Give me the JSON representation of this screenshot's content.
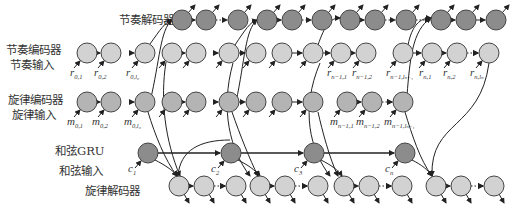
{
  "labels": {
    "rhythm_decoder": "节奏解码器",
    "rhythm_encoder": "节奏编码器",
    "rhythm_input": "节奏输入",
    "melody_encoder": "旋律编码器",
    "melody_input": "旋律输入",
    "chord_gru": "和弦GRU",
    "chord_input": "和弦输入",
    "melody_decoder": "旋律解码器"
  },
  "colors": {
    "dark_node": "#8c8c8c",
    "mid_node": "#b4b4b4",
    "light_node": "#d2d2d2",
    "stroke": "#444444",
    "text": "#333333"
  },
  "rows": {
    "rhythm_decoder": {
      "y": 20,
      "nodes": [
        182,
        206,
        238,
        267,
        292,
        322,
        350,
        375,
        406,
        441,
        466,
        496
      ]
    },
    "rhythm_encoder": {
      "y": 53,
      "nodes": [
        87,
        111,
        145,
        172,
        196,
        229,
        256,
        282,
        313,
        341,
        366,
        403,
        432,
        457,
        489
      ]
    },
    "melody_encoder": {
      "y": 102,
      "nodes": [
        87,
        111,
        145,
        172,
        196,
        229,
        256,
        282,
        313,
        347,
        372,
        403
      ]
    },
    "chord_gru": {
      "y": 153,
      "nodes": [
        148,
        231,
        314,
        405
      ]
    },
    "melody_decoder": {
      "y": 186,
      "nodes": [
        179,
        204,
        236,
        260,
        285,
        318,
        344,
        369,
        402,
        436,
        461,
        494
      ]
    }
  },
  "input_labels": {
    "rhythm": [
      {
        "base": "r",
        "sub": "0,1",
        "x": 70
      },
      {
        "base": "r",
        "sub": "0,2",
        "x": 94
      },
      {
        "base": "r",
        "sub": "0,l₀",
        "x": 126
      },
      {
        "base": "r",
        "sub": "n−1,1",
        "x": 327
      },
      {
        "base": "r",
        "sub": "n−1,2",
        "x": 352
      },
      {
        "base": "r",
        "sub": "n−1,lₙ₋₁",
        "x": 386
      },
      {
        "base": "r",
        "sub": "n,1",
        "x": 419
      },
      {
        "base": "r",
        "sub": "n,2",
        "x": 443
      },
      {
        "base": "r",
        "sub": "n,lₙ",
        "x": 470
      }
    ],
    "melody": [
      {
        "base": "m",
        "sub": "0,1",
        "x": 67
      },
      {
        "base": "m",
        "sub": "0,2",
        "x": 92
      },
      {
        "base": "m",
        "sub": "0,l₀",
        "x": 124
      },
      {
        "base": "m",
        "sub": "n−1,1",
        "x": 330
      },
      {
        "base": "m",
        "sub": "n−1,2",
        "x": 356
      },
      {
        "base": "m",
        "sub": "n−1,lₙ₋₁",
        "x": 384
      }
    ],
    "chord": [
      {
        "base": "c",
        "sub": "1",
        "x": 128
      },
      {
        "base": "c",
        "sub": "2",
        "x": 211
      },
      {
        "base": "c",
        "sub": "3",
        "x": 294
      },
      {
        "base": "c",
        "sub": "n",
        "x": 385
      }
    ]
  }
}
